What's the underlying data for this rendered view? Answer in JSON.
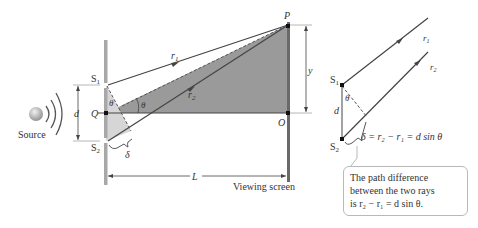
{
  "labels": {
    "source": "Source",
    "s1": "S",
    "s1_sub": "1",
    "s2": "S",
    "s2_sub": "2",
    "q": "Q",
    "d": "d",
    "theta": "θ",
    "delta": "δ",
    "p": "P",
    "o": "O",
    "y": "y",
    "L": "L",
    "r1": "r",
    "r1_sub": "1",
    "r2": "r",
    "r2_sub": "2",
    "viewing_screen": "Viewing screen"
  },
  "inset": {
    "s1": "S",
    "s1_sub": "1",
    "s2": "S",
    "s2_sub": "2",
    "d": "d",
    "theta": "θ",
    "r1": "r",
    "r1_sub": "1",
    "r2": "r",
    "r2_sub": "2",
    "equation": "δ = r₂ − r₁ = d sin θ"
  },
  "callout": {
    "line1": "The path difference",
    "line2": "between the two rays",
    "line3": "is r₂ − r₁ = d sin θ."
  },
  "colors": {
    "shade_dark": "#9a9a9a",
    "shade_light": "#d6d6d6",
    "barrier": "#a8a8a8",
    "screen": "#6a6a6a",
    "line": "#444444"
  }
}
